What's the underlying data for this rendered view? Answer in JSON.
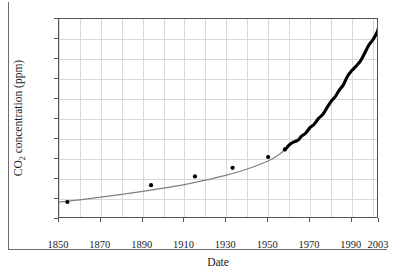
{
  "chart_data": {
    "type": "line",
    "title": "",
    "xlabel": "Date",
    "ylabel_text": "CO2 concentration (ppm)",
    "ylabel_base": "CO",
    "ylabel_sub": "2",
    "ylabel_rest": " concentration (ppm)",
    "xlim": [
      1850,
      2003
    ],
    "ylim": [
      280,
      380
    ],
    "grid": true,
    "legend": "none",
    "xticks": [
      1850,
      1870,
      1890,
      1910,
      1930,
      1950,
      1970,
      1990,
      2003
    ],
    "xtick_labels": [
      "1850",
      "1870",
      "1890",
      "1910",
      "1930",
      "1950",
      "1970",
      "1990",
      "2003"
    ],
    "yticks": [
      280,
      290,
      300,
      310,
      320,
      330,
      340,
      350,
      360,
      370,
      380
    ],
    "ytick_labels": [
      "280",
      "290",
      "300",
      "310",
      "320",
      "330",
      "340",
      "350",
      "360",
      "370",
      "380"
    ],
    "xgrid_minor_step": 10,
    "ygrid_step": 10,
    "series": [
      {
        "name": "ice-core-and-mauna-loa-fit",
        "style": "line",
        "color": "#808080",
        "x": [
          1850,
          1860,
          1870,
          1880,
          1890,
          1900,
          1910,
          1920,
          1930,
          1940,
          1950,
          1955,
          1958
        ],
        "values": [
          288.4,
          289.6,
          290.9,
          292.3,
          293.8,
          295.4,
          297.2,
          299.4,
          301.9,
          305.0,
          309.0,
          312.1,
          314.6
        ]
      },
      {
        "name": "mauna-loa-record",
        "style": "points-dense",
        "color": "#000000",
        "x": [
          1958,
          1960,
          1962,
          1964,
          1966,
          1968,
          1970,
          1972,
          1974,
          1976,
          1978,
          1980,
          1982,
          1984,
          1986,
          1988,
          1990,
          1992,
          1994,
          1996,
          1998,
          2000,
          2002,
          2003
        ],
        "values": [
          314.6,
          316.9,
          318.4,
          319.2,
          321.4,
          323.0,
          325.7,
          327.4,
          330.2,
          332.1,
          335.4,
          338.7,
          341.1,
          344.4,
          347.2,
          351.5,
          354.2,
          356.4,
          358.8,
          362.6,
          366.7,
          369.5,
          373.2,
          376.5
        ]
      },
      {
        "name": "sparse-ice-core-markers",
        "style": "markers",
        "color": "#000000",
        "x": [
          1854,
          1894,
          1915,
          1933,
          1950,
          1958
        ],
        "values": [
          288.5,
          296.9,
          301.3,
          305.6,
          311.0,
          314.8
        ]
      }
    ]
  }
}
